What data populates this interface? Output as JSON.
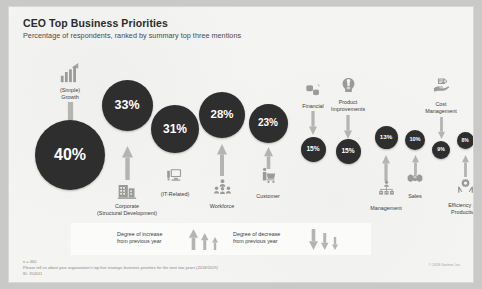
{
  "header": {
    "title": "CEO Top Business Priorities",
    "subtitle": "Percentage of respondents, ranked by summary top three mentions"
  },
  "chart_data": {
    "type": "bar",
    "title": "CEO Top Business Priorities",
    "subtitle": "Percentage of respondents, ranked by summary top three mentions",
    "xlabel": "",
    "ylabel": "Percentage of respondents",
    "ylim": [
      0,
      40
    ],
    "grid": false,
    "legend_position": "bottom",
    "categories": [
      "(Simple) Growth",
      "Corporate (Structural Development)",
      "(IT-Related)",
      "Workforce",
      "Customer",
      "Financial",
      "Product Improvements",
      "Management",
      "Sales",
      "Cost Management",
      "Efficiency and Productivity"
    ],
    "values": [
      40,
      33,
      31,
      28,
      23,
      15,
      15,
      13,
      10,
      9,
      8
    ],
    "value_labels": [
      "40%",
      "33%",
      "31%",
      "28%",
      "23%",
      "15%",
      "15%",
      "13%",
      "10%",
      "9%",
      "8%"
    ],
    "trend": [
      "decrease",
      "increase",
      "increase",
      "increase",
      "increase",
      "decrease",
      "decrease",
      "increase",
      "increase",
      "decrease",
      "increase"
    ]
  },
  "nodes": [
    {
      "id": "growth",
      "value": "40%",
      "label": "(Simple)\nGrowth",
      "icon": "bar-chart-growth-icon",
      "trend": "decrease"
    },
    {
      "id": "corporate",
      "value": "33%",
      "label": "Corporate\n(Structural Development)",
      "icon": "office-building-icon",
      "trend": "increase"
    },
    {
      "id": "it",
      "value": "31%",
      "label": "(IT-Related)",
      "icon": "computer-icon",
      "trend": "increase"
    },
    {
      "id": "workforce",
      "value": "28%",
      "label": "Workforce",
      "icon": "people-group-icon",
      "trend": "increase"
    },
    {
      "id": "customer",
      "value": "23%",
      "label": "Customer",
      "icon": "shopping-cart-icon",
      "trend": "increase"
    },
    {
      "id": "financial",
      "value": "15%",
      "label": "Financial",
      "icon": "coins-icon",
      "trend": "decrease"
    },
    {
      "id": "product",
      "value": "15%",
      "label": "Product\nImprovements",
      "icon": "lightbulb-head-icon",
      "trend": "decrease"
    },
    {
      "id": "management",
      "value": "13%",
      "label": "Management",
      "icon": "org-chart-icon",
      "trend": "increase"
    },
    {
      "id": "sales",
      "value": "10%",
      "label": "Sales",
      "icon": "handshake-icon",
      "trend": "increase"
    },
    {
      "id": "cost",
      "value": "9%",
      "label": "Cost\nManagement",
      "icon": "hand-money-icon",
      "trend": "decrease"
    },
    {
      "id": "efficiency",
      "value": "8%",
      "label": "Efficiency and\nProductivity",
      "icon": "hands-gear-icon",
      "trend": "increase"
    }
  ],
  "legend": {
    "increase": "Degree of increase\nfrom previous year",
    "decrease": "Degree of decrease\nfrom previous year"
  },
  "footer": {
    "n": "n = 460",
    "question": "Please tell us about your organization's top five strategic business priorities for the next two years (2018/2019)",
    "id": "ID: 354011",
    "copyright": "© 2018 Gartner, Inc."
  },
  "colors": {
    "bubble": "#2e2e2e",
    "icon": "#9a9a98",
    "arrow": "#b4b4b2",
    "card": "#f4f4f2",
    "background": "#c9c9c7"
  }
}
